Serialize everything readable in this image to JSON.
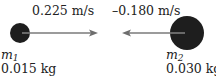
{
  "diagram": {
    "ball1": {
      "mass_symbol": "m",
      "mass_subscript": "1",
      "mass_value": "0.015 kg",
      "velocity_label": "0.225 m/s",
      "color": "#1e1e1e"
    },
    "ball2": {
      "mass_symbol": "m",
      "mass_subscript": "2",
      "mass_value": "0.030 kg",
      "velocity_label": "–0.180 m/s",
      "color": "#1e1e1e"
    },
    "arrow_color": "#7a7a7a"
  }
}
